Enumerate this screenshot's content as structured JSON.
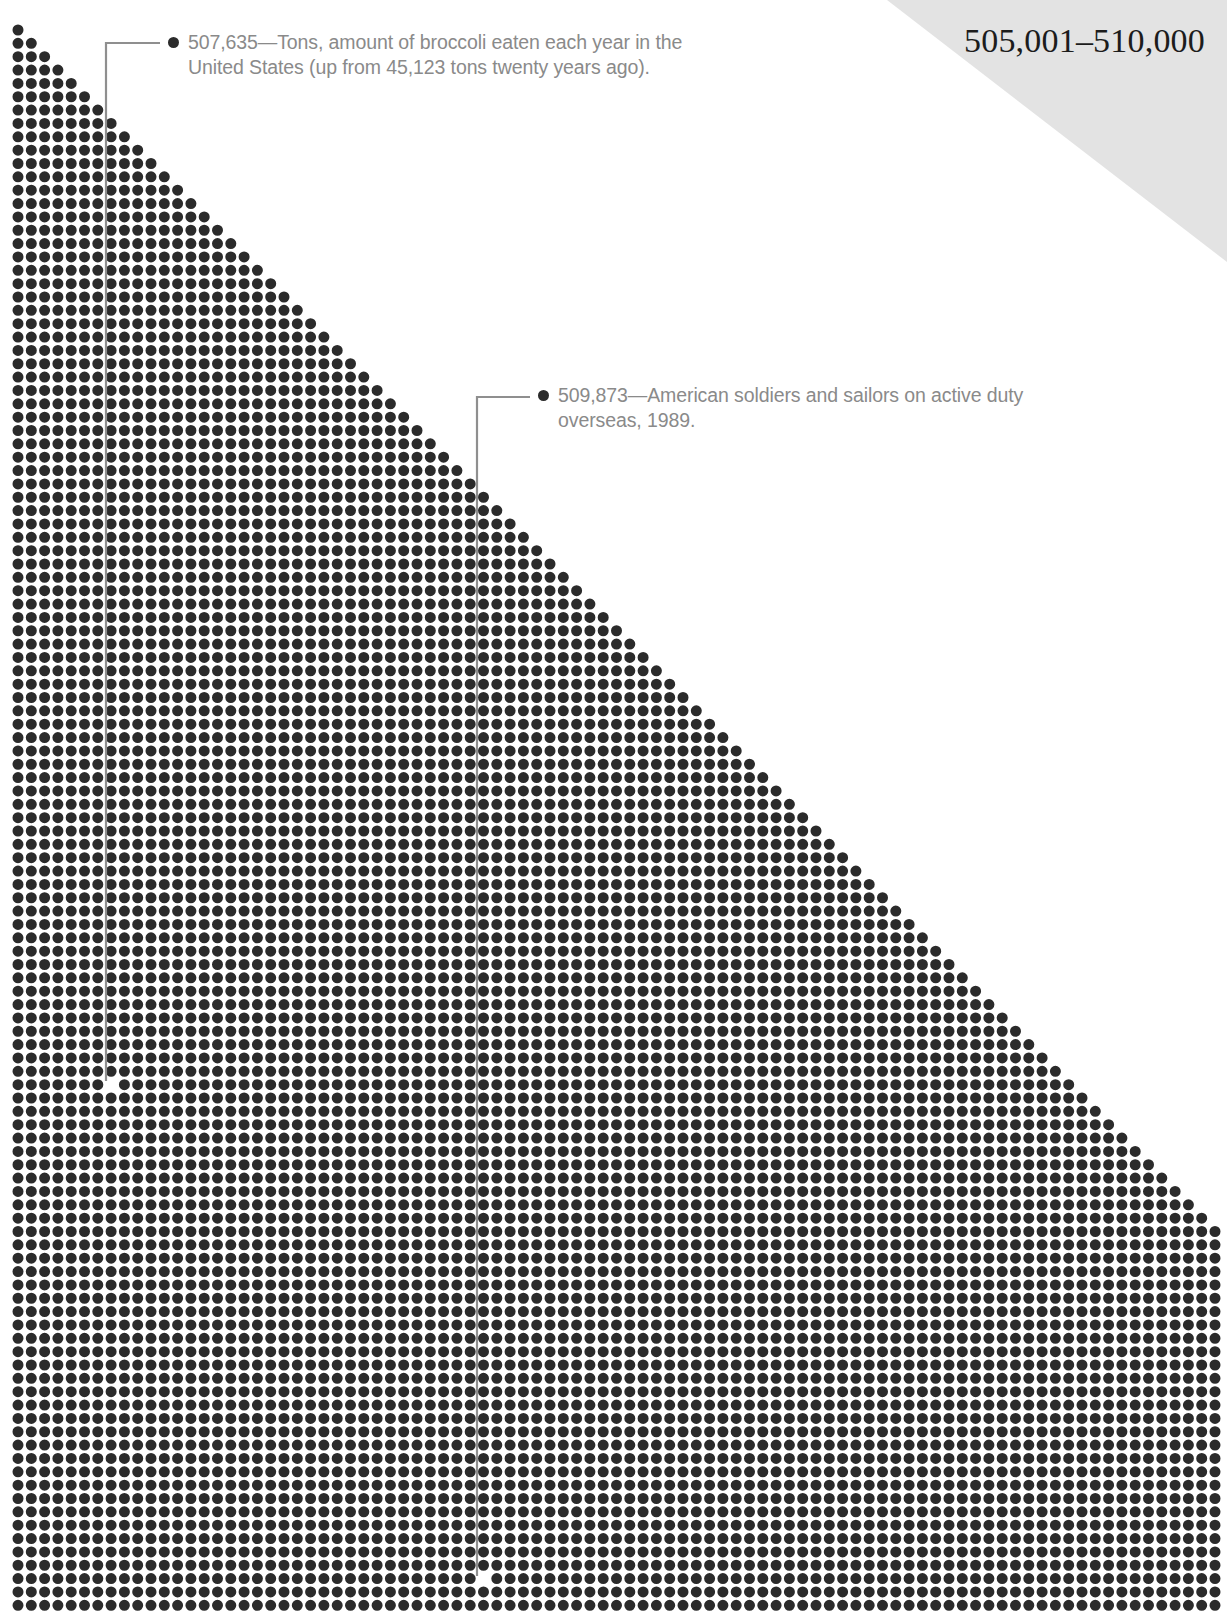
{
  "page": {
    "range_label": "505,001–510,000",
    "background_color": "#ffffff",
    "dot_color": "#2b2b2b",
    "banner_color": "#e3e3e3",
    "text_color": "#8a8a8a",
    "leader_color": "#8f8f8f"
  },
  "annotations": [
    {
      "id": "broccoli",
      "value": "507,635",
      "separator": "—",
      "text": "507,635—Tons, amount of broccoli eaten each year in the United States (up from 45,123 tons twenty years ago).",
      "bullet_icon": "filled-circle-icon"
    },
    {
      "id": "soldiers",
      "value": "509,873",
      "separator": "—",
      "text": "509,873—American soldiers and sailors on active duty overseas, 1989.",
      "bullet_icon": "filled-circle-icon"
    }
  ],
  "chart_data": {
    "type": "scatter",
    "title": "505,001–510,000",
    "xlabel": "",
    "ylabel": "",
    "grid": {
      "origin_x": 18,
      "origin_y": 30,
      "pitch_x": 13.3,
      "pitch_y": 13.35,
      "dot_radius": 5.5,
      "rows": 119,
      "first_row_count": 1,
      "row_growth": 1,
      "max_columns": 91
    },
    "callout_targets": [
      {
        "id": "broccoli",
        "col": 7,
        "row": 79,
        "x": 113,
        "y": 1081
      },
      {
        "id": "soldiers",
        "col": 35,
        "row": 116,
        "x": 488,
        "y": 1575
      }
    ],
    "legend": []
  }
}
